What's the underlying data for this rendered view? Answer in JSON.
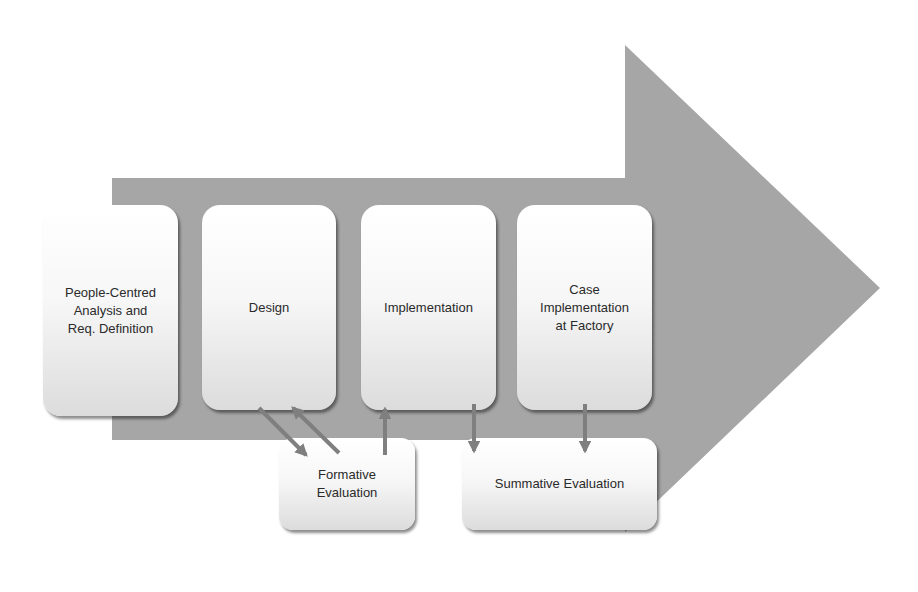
{
  "diagram": {
    "type": "process-flow",
    "colors": {
      "big_arrow": "#a6a6a6",
      "connector": "#7f7f7f",
      "box_top": "#ffffff",
      "box_bottom": "#dcdcdc",
      "text": "#2a2a2a"
    },
    "stages": [
      {
        "id": "analysis",
        "label": "People-Centred\nAnalysis and\nReq. Definition"
      },
      {
        "id": "design",
        "label": "Design"
      },
      {
        "id": "implementation",
        "label": "Implementation"
      },
      {
        "id": "case",
        "label": "Case\nImplementation\nat Factory"
      }
    ],
    "evaluations": [
      {
        "id": "formative",
        "label": "Formative\nEvaluation"
      },
      {
        "id": "summative",
        "label": "Summative Evaluation"
      }
    ],
    "connectors": [
      {
        "from": "design",
        "to": "formative",
        "direction": "down-right"
      },
      {
        "from": "formative",
        "to": "design",
        "direction": "up-left"
      },
      {
        "from": "formative",
        "to": "implementation",
        "direction": "up"
      },
      {
        "from": "implementation",
        "to": "summative",
        "direction": "down"
      },
      {
        "from": "case",
        "to": "summative",
        "direction": "down"
      }
    ]
  }
}
